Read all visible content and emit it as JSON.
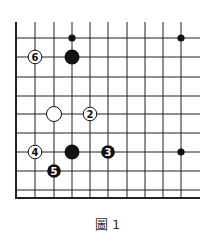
{
  "caption": "圖 1",
  "board": {
    "left_edge_x": 16,
    "bottom_edge_y": 198,
    "top_y": 22,
    "right_x": 200,
    "vertical_lines_x": [
      16,
      35,
      54,
      72,
      90,
      108,
      127,
      145,
      163,
      181
    ],
    "horizontal_lines_y": [
      38,
      57,
      77,
      96,
      114,
      133,
      152,
      171,
      190
    ],
    "line_color": "#222222"
  },
  "stones": [
    {
      "color": "black",
      "size": "small",
      "x": 72,
      "y": 38,
      "label": ""
    },
    {
      "color": "black",
      "size": "small",
      "x": 181,
      "y": 38,
      "label": ""
    },
    {
      "color": "black",
      "size": "large",
      "x": 72,
      "y": 57,
      "label": ""
    },
    {
      "color": "white",
      "size": "numbered",
      "x": 35,
      "y": 57,
      "label": "6"
    },
    {
      "color": "white",
      "size": "large",
      "x": 54,
      "y": 114,
      "label": ""
    },
    {
      "color": "white",
      "size": "numbered",
      "x": 90,
      "y": 114,
      "label": "2"
    },
    {
      "color": "white",
      "size": "numbered",
      "x": 35,
      "y": 152,
      "label": "4"
    },
    {
      "color": "black",
      "size": "large",
      "x": 72,
      "y": 152,
      "label": ""
    },
    {
      "color": "black",
      "size": "numbered",
      "x": 108,
      "y": 152,
      "label": "3"
    },
    {
      "color": "black",
      "size": "small",
      "x": 181,
      "y": 152,
      "label": ""
    },
    {
      "color": "black",
      "size": "numbered",
      "x": 54,
      "y": 171,
      "label": "5"
    }
  ]
}
